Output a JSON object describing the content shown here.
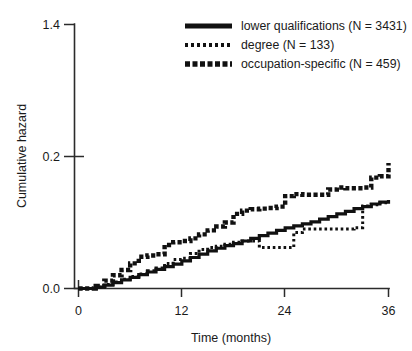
{
  "chart_data": {
    "type": "line",
    "title": "",
    "xlabel": "Time (months)",
    "ylabel": "Cumulative hazard",
    "xlim": [
      0,
      36
    ],
    "ylim": [
      0.0,
      0.4
    ],
    "xticks": [
      0,
      12,
      24,
      36
    ],
    "xtick_labels": [
      "0",
      "12",
      "24",
      "36"
    ],
    "yticks": [
      0.0,
      0.2,
      0.4
    ],
    "ytick_labels": [
      "0.0",
      "0.2",
      "1.4"
    ],
    "grid": false,
    "legend_position": "top-right",
    "series": [
      {
        "name": "lower qualifications (N = 3431)",
        "label": "lower qualifications (N = 3431)",
        "n": 3431,
        "style": "solid",
        "color": "#111111",
        "x": [
          0,
          1,
          2,
          3,
          4,
          5,
          6,
          7,
          8,
          9,
          10,
          11,
          12,
          13,
          14,
          15,
          16,
          17,
          18,
          19,
          20,
          21,
          22,
          23,
          24,
          25,
          26,
          27,
          28,
          29,
          30,
          31,
          32,
          33,
          34,
          35,
          36
        ],
        "y": [
          0.0,
          0.0,
          0.002,
          0.005,
          0.009,
          0.013,
          0.017,
          0.021,
          0.025,
          0.029,
          0.033,
          0.037,
          0.042,
          0.047,
          0.052,
          0.057,
          0.061,
          0.065,
          0.068,
          0.072,
          0.076,
          0.08,
          0.084,
          0.088,
          0.092,
          0.095,
          0.098,
          0.101,
          0.105,
          0.109,
          0.113,
          0.117,
          0.121,
          0.124,
          0.128,
          0.131,
          0.134
        ]
      },
      {
        "name": "degree (N = 133)",
        "label": "degree (N = 133)",
        "n": 133,
        "style": "fine-dotted",
        "color": "#111111",
        "x": [
          0,
          1,
          2,
          3,
          4,
          5,
          6,
          7,
          8,
          9,
          10,
          11,
          12,
          13,
          14,
          15,
          16,
          17,
          18,
          19,
          20,
          21,
          22,
          23,
          24,
          25,
          26,
          27,
          28,
          29,
          30,
          31,
          32,
          33,
          34,
          35,
          36
        ],
        "y": [
          0.0,
          0.0,
          0.002,
          0.006,
          0.01,
          0.014,
          0.018,
          0.022,
          0.027,
          0.031,
          0.038,
          0.044,
          0.046,
          0.053,
          0.059,
          0.062,
          0.064,
          0.067,
          0.07,
          0.072,
          0.072,
          0.062,
          0.062,
          0.062,
          0.062,
          0.085,
          0.09,
          0.09,
          0.09,
          0.09,
          0.09,
          0.09,
          0.092,
          0.125,
          0.127,
          0.13,
          0.134
        ]
      },
      {
        "name": "occupation-specific (N = 459)",
        "label": "occupation-specific (N = 459)",
        "n": 459,
        "style": "bold-dotted",
        "color": "#111111",
        "x": [
          0,
          1,
          2,
          3,
          4,
          5,
          6,
          7,
          8,
          9,
          10,
          11,
          12,
          13,
          14,
          15,
          16,
          17,
          18,
          19,
          20,
          21,
          22,
          23,
          24,
          25,
          26,
          27,
          28,
          29,
          30,
          31,
          32,
          33,
          34,
          35,
          36
        ],
        "y": [
          0.0,
          0.0,
          0.004,
          0.012,
          0.02,
          0.028,
          0.038,
          0.048,
          0.05,
          0.052,
          0.066,
          0.07,
          0.072,
          0.076,
          0.082,
          0.088,
          0.094,
          0.1,
          0.113,
          0.118,
          0.12,
          0.121,
          0.122,
          0.124,
          0.14,
          0.143,
          0.142,
          0.142,
          0.142,
          0.15,
          0.153,
          0.152,
          0.152,
          0.153,
          0.168,
          0.17,
          0.19
        ]
      }
    ]
  },
  "axes": {
    "y_title": "Cumulative hazard",
    "x_title": "Time (months)",
    "y_tick_top": "1.4",
    "y_tick_mid": "0.2",
    "y_tick_bottom": "0.0",
    "x_tick_0": "0",
    "x_tick_12": "12",
    "x_tick_24": "24",
    "x_tick_36": "36"
  },
  "legend": {
    "entries": [
      {
        "label": "lower qualifications (N = 3431)",
        "swatch": "solid-line-swatch"
      },
      {
        "label": "degree (N = 133)",
        "swatch": "fine-dotted-line-swatch"
      },
      {
        "label": "occupation-specific (N = 459)",
        "swatch": "bold-dotted-line-swatch"
      }
    ]
  },
  "colors": {
    "ink": "#111111",
    "axis": "#2b2b2b",
    "background": "#ffffff"
  }
}
